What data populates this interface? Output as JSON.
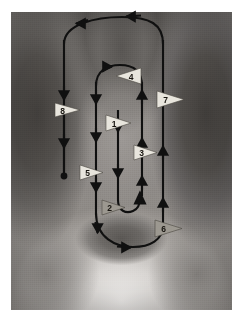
{
  "figure": {
    "background_kind": "photograph",
    "frame": {
      "x": 11,
      "y": 12,
      "width": 221,
      "height": 298,
      "margin_color": "#ffffff"
    }
  },
  "style": {
    "path_color": "#101010",
    "path_width": 2.1,
    "marker_fill_light": "#e8e5dd",
    "marker_fill_dark": "#9c9890",
    "marker_stroke": "#4a4640",
    "label_color": "#17140f",
    "terminus_dot_color": "#101010"
  },
  "markers": [
    {
      "id": "marker-1",
      "label": "1",
      "x": 116,
      "y": 123,
      "direction": "right",
      "shade": "light"
    },
    {
      "id": "marker-2",
      "label": "2",
      "x": 112,
      "y": 207,
      "direction": "right",
      "shade": "dark"
    },
    {
      "id": "marker-3",
      "label": "3",
      "x": 143,
      "y": 152,
      "direction": "right",
      "shade": "light"
    },
    {
      "id": "marker-4",
      "label": "4",
      "x": 128,
      "y": 75,
      "direction": "left",
      "shade": "light"
    },
    {
      "id": "marker-5",
      "label": "5",
      "x": 90,
      "y": 172,
      "direction": "right",
      "shade": "light"
    },
    {
      "id": "marker-6",
      "label": "6",
      "x": 165,
      "y": 228,
      "direction": "right",
      "shade": "dark"
    },
    {
      "id": "marker-7",
      "label": "7",
      "x": 172,
      "y": 99,
      "direction": "right",
      "shade": "light"
    },
    {
      "id": "marker-8",
      "label": "8",
      "x": 68,
      "y": 110,
      "direction": "right",
      "shade": "light"
    }
  ],
  "path_segments": [
    {
      "id": "outer-top-curve",
      "kind": "curve",
      "flow": "right-to-left",
      "arrowheads": 2
    },
    {
      "id": "outer-left-vertical",
      "kind": "line",
      "flow": "downward",
      "arrowheads": 2,
      "terminates_in_dot": true
    },
    {
      "id": "outer-right-vertical",
      "kind": "line",
      "flow": "upward",
      "arrowheads": 2
    },
    {
      "id": "outer-bottom-curve",
      "kind": "curve",
      "flow": "left-to-right",
      "arrowheads": 2
    },
    {
      "id": "inner-top-curve",
      "kind": "curve",
      "flow": "left-to-right",
      "arrowheads": 1
    },
    {
      "id": "inner-left-vertical",
      "kind": "line",
      "flow": "downward",
      "arrowheads": 3
    },
    {
      "id": "inner-right-vertical",
      "kind": "line",
      "flow": "upward",
      "arrowheads": 3
    },
    {
      "id": "inner-center-vertical",
      "kind": "line",
      "flow": "downward",
      "arrowheads": 2
    },
    {
      "id": "inner-bottom-uturn",
      "kind": "curve",
      "flow": "left-to-right",
      "arrowheads": 1
    }
  ]
}
